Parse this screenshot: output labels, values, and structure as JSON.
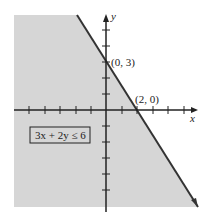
{
  "graph": {
    "inequality": "3x + 2y ≤ 6",
    "x_axis_label": "x",
    "y_axis_label": "y",
    "points": [
      {
        "label": "(0, 3)",
        "x": 0,
        "y": 3
      },
      {
        "label": "(2, 0)",
        "x": 2,
        "y": 0
      }
    ],
    "boundary_line": "3x + 2y = 6",
    "shaded_region": "below/left of line",
    "colors": {
      "shade": "#d6d6d6",
      "line": "#333333",
      "axis": "#222222"
    }
  }
}
